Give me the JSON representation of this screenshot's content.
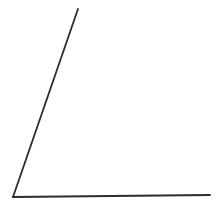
{
  "figure": {
    "title": "Acute angle formed by two rays",
    "background_color": "#ffffff",
    "stroke_color": "#2c2c2c",
    "stroke_width": 1.8,
    "canvas": {
      "width": 221,
      "height": 204
    },
    "vertex": {
      "label": "vertex",
      "x": 13,
      "y": 197
    },
    "rays": [
      {
        "name": "ray-diagonal",
        "label": "Diagonal ray (upper side)",
        "from": {
          "x": 13,
          "y": 197
        },
        "to": {
          "x": 78,
          "y": 9
        },
        "orientation": "up-and-right",
        "angle_from_horizontal_deg": 71
      },
      {
        "name": "ray-horizontal",
        "label": "Horizontal ray (base side)",
        "from": {
          "x": 13,
          "y": 197
        },
        "to": {
          "x": 210,
          "y": 195
        },
        "orientation": "right",
        "angle_from_horizontal_deg": 1
      }
    ],
    "angle": {
      "name": "interior-angle",
      "measure_deg": 70,
      "type": "acute",
      "label": ""
    },
    "annotations": []
  }
}
